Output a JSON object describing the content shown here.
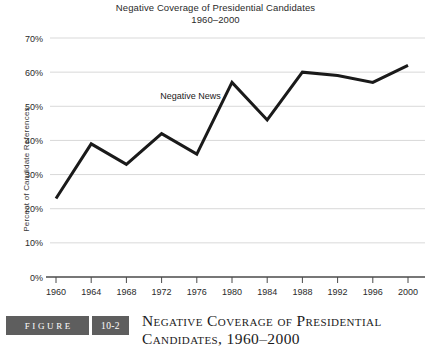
{
  "chart_data": {
    "type": "line",
    "title": "Negative Coverage of Presidential Candidates",
    "subtitle": "1960–2000",
    "xlabel": "",
    "ylabel": "Percent of Candidate References",
    "categories": [
      "1960",
      "1964",
      "1968",
      "1972",
      "1976",
      "1980",
      "1984",
      "1988",
      "1992",
      "1996",
      "2000"
    ],
    "series": [
      {
        "name": "Negative News",
        "values": [
          23,
          39,
          33,
          42,
          36,
          57,
          46,
          60,
          59,
          57,
          62
        ]
      }
    ],
    "ylim": [
      0,
      70
    ],
    "ytick_values": [
      0,
      10,
      20,
      30,
      40,
      50,
      60,
      70
    ],
    "ytick_labels": [
      "0%",
      "10%",
      "20%",
      "30%",
      "40%",
      "50%",
      "60%",
      "70%"
    ],
    "xtick_labels": [
      "1960",
      "1964",
      "1968",
      "1972",
      "1976",
      "1980",
      "1984",
      "1988",
      "1992",
      "1996",
      "2000"
    ],
    "grid": true,
    "legend_position": "inline-annotation",
    "annotations": [
      {
        "text": "Negative News",
        "near_category": "1976"
      }
    ],
    "colors": {
      "line": "#1a1a1a",
      "grid": "#d9d9d9",
      "axis": "#4a4a4a",
      "text": "#2a2a2a"
    }
  },
  "caption": {
    "figure_label": "FIGURE",
    "figure_number": "10-2",
    "title_line1": "Negative Coverage of Presidential",
    "title_line2": "Candidates, 1960–2000",
    "badge_color": "#5e5e5e"
  }
}
